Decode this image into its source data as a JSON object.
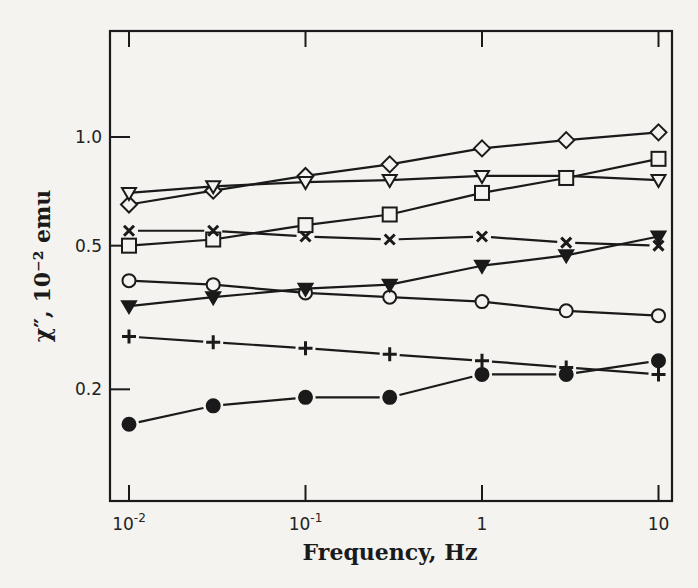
{
  "chart_data": {
    "type": "line",
    "title": "",
    "xlabel": "Frequency, Hz",
    "ylabel": "χ″, 10⁻² emu",
    "xscale": "log",
    "yscale": "log",
    "xlim": [
      0.0075,
      13
    ],
    "ylim": [
      0.125,
      1.6
    ],
    "x_ticks": [
      {
        "value": 0.01,
        "label": "10⁻²"
      },
      {
        "value": 0.1,
        "label": "10⁻¹"
      },
      {
        "value": 1,
        "label": "1"
      },
      {
        "value": 10,
        "label": "10"
      }
    ],
    "y_ticks": [
      {
        "value": 1.0,
        "label": "1.0"
      },
      {
        "value": 0.5,
        "label": "0.5"
      },
      {
        "value": 0.2,
        "label": "0.2"
      }
    ],
    "grid": false,
    "legend": "none",
    "x": [
      0.01,
      0.03,
      0.1,
      0.3,
      1,
      3,
      10
    ],
    "series": [
      {
        "name": "open-diamond",
        "marker": "diamond-open",
        "values": [
          0.65,
          0.71,
          0.78,
          0.84,
          0.93,
          0.98,
          1.03
        ]
      },
      {
        "name": "open-triangle-down",
        "marker": "triangle-down-open",
        "values": [
          0.7,
          0.73,
          0.75,
          0.76,
          0.78,
          0.78,
          0.76
        ]
      },
      {
        "name": "open-square",
        "marker": "square-open",
        "values": [
          0.5,
          0.52,
          0.57,
          0.61,
          0.7,
          0.77,
          0.87
        ]
      },
      {
        "name": "cross",
        "marker": "x",
        "values": [
          0.55,
          0.55,
          0.53,
          0.52,
          0.53,
          0.51,
          0.5
        ]
      },
      {
        "name": "open-circle",
        "marker": "circle-open",
        "values": [
          0.4,
          0.39,
          0.37,
          0.36,
          0.35,
          0.33,
          0.32
        ]
      },
      {
        "name": "filled-triangle-down",
        "marker": "triangle-down-filled",
        "values": [
          0.34,
          0.36,
          0.38,
          0.39,
          0.44,
          0.47,
          0.53
        ]
      },
      {
        "name": "plus",
        "marker": "plus",
        "values": [
          0.28,
          0.27,
          0.26,
          0.25,
          0.24,
          0.23,
          0.22
        ]
      },
      {
        "name": "filled-circle",
        "marker": "circle-filled",
        "values": [
          0.16,
          0.18,
          0.19,
          0.19,
          0.22,
          0.22,
          0.24
        ]
      }
    ]
  },
  "colors": {
    "ink": "#1a1a1a",
    "paper": "#f4f3ef"
  }
}
